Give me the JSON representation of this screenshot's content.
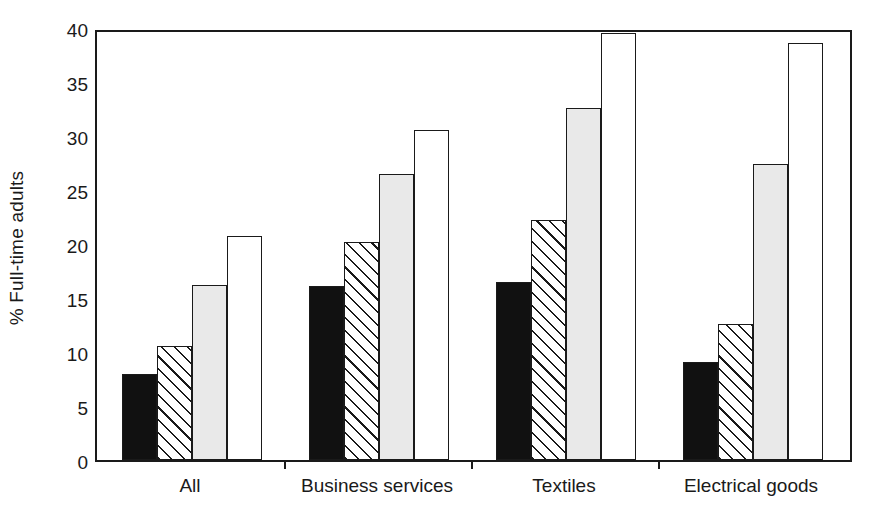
{
  "chart_data": {
    "type": "bar",
    "title": "",
    "subtitle": "",
    "xlabel": "",
    "ylabel": "% Full-time adults",
    "ylim": [
      0,
      40
    ],
    "yticks": [
      0,
      5,
      10,
      15,
      20,
      25,
      30,
      35,
      40
    ],
    "ytick_labels": [
      "0",
      "5",
      "10",
      "15",
      "20",
      "25",
      "30",
      "35",
      "40"
    ],
    "grid": false,
    "legend": "none",
    "categories": [
      "All",
      "Business services",
      "Textiles",
      "Electrical goods"
    ],
    "series": [
      {
        "name": "series-1",
        "style": "solid-black",
        "values": [
          8.0,
          16.1,
          16.5,
          9.1
        ]
      },
      {
        "name": "series-2",
        "style": "diagonal-hatch",
        "values": [
          10.6,
          20.2,
          22.2,
          12.6
        ]
      },
      {
        "name": "series-3",
        "style": "light-gray",
        "values": [
          16.2,
          26.5,
          32.6,
          27.4
        ]
      },
      {
        "name": "series-4",
        "style": "white-outline",
        "values": [
          20.7,
          30.6,
          39.5,
          38.6
        ]
      }
    ]
  },
  "colors": {
    "solid": "#111111",
    "gray": "#e9e9e9",
    "open": "#ffffff",
    "axis": "#1a1a1a"
  }
}
